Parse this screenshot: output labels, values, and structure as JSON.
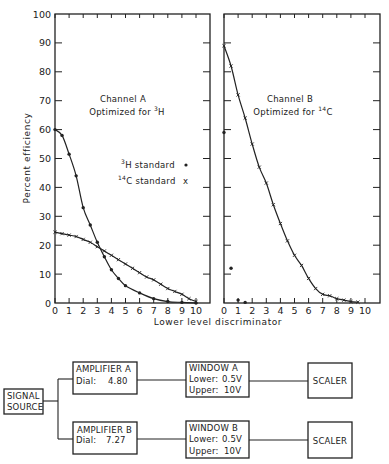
{
  "chart_data": [
    {
      "type": "line",
      "panel": "left",
      "title": "Channel A",
      "subtitle": "Optimized for 3H",
      "subtitle_parts": {
        "text": "Optimized for ",
        "sup": "3",
        "tail": "H"
      },
      "xlabel": "Lower level discriminator",
      "ylabel": "Percent efficiency",
      "xlim": [
        0,
        10
      ],
      "ylim": [
        0,
        100
      ],
      "x_ticks": [
        "0",
        "1",
        "2",
        "3",
        "4",
        "5",
        "6",
        "7",
        "8",
        "9",
        "10"
      ],
      "y_ticks": [
        "0",
        "10",
        "20",
        "30",
        "40",
        "50",
        "60",
        "70",
        "80",
        "90",
        "100"
      ],
      "y_tick_values": [
        0,
        10,
        20,
        30,
        40,
        50,
        60,
        70,
        80,
        90,
        100
      ],
      "grid": false,
      "legend": {
        "placement": "center-right",
        "entries": [
          {
            "sup": "3",
            "label": "H standard",
            "marker": "dot",
            "symbol": "•"
          },
          {
            "sup": "14",
            "label": "C standard",
            "marker": "cross",
            "symbol": "x"
          }
        ]
      },
      "series": [
        {
          "name": "3H standard",
          "marker": "dot",
          "x": [
            0,
            0.5,
            1,
            1.5,
            2,
            2.5,
            3,
            3.5,
            4,
            4.5,
            5,
            6,
            7,
            8,
            9,
            10
          ],
          "y": [
            60,
            58,
            51.5,
            44,
            33,
            27,
            21,
            16,
            11.5,
            8.5,
            6,
            3.5,
            1.5,
            0.5,
            0.2,
            0
          ]
        },
        {
          "name": "14C standard",
          "marker": "cross",
          "x": [
            0,
            0.5,
            1,
            1.5,
            2,
            2.5,
            3,
            3.5,
            4,
            4.5,
            5,
            5.5,
            6,
            6.5,
            7,
            7.5,
            8,
            8.5,
            9,
            9.5,
            10
          ],
          "y": [
            24.5,
            24,
            23.5,
            23,
            22,
            21,
            19.5,
            18,
            16.5,
            15,
            13.5,
            12,
            10.5,
            9,
            8,
            6.5,
            5,
            4,
            3,
            1.5,
            0.5
          ]
        }
      ]
    },
    {
      "type": "line",
      "panel": "right",
      "title": "Channel B",
      "subtitle": "Optimized for 14C",
      "subtitle_parts": {
        "text": "Optimized for ",
        "sup": "14",
        "tail": "C"
      },
      "xlabel": "Lower level discriminator",
      "ylabel": "Percent efficiency",
      "xlim": [
        0,
        10
      ],
      "ylim": [
        0,
        100
      ],
      "x_ticks": [
        "0",
        "1",
        "2",
        "3",
        "4",
        "5",
        "6",
        "7",
        "8",
        "9",
        "10"
      ],
      "y_tick_values": [
        0,
        10,
        20,
        30,
        40,
        50,
        60,
        70,
        80,
        90,
        100
      ],
      "grid": false,
      "series": [
        {
          "name": "14C standard",
          "marker": "cross",
          "x": [
            0,
            0.5,
            1,
            1.5,
            2,
            2.5,
            3,
            3.5,
            4,
            4.5,
            5,
            5.5,
            6,
            6.5,
            7,
            7.5,
            8,
            8.5,
            9,
            9.5
          ],
          "y": [
            89,
            82,
            72,
            64,
            55,
            47,
            41.5,
            34,
            27.5,
            21.5,
            16.5,
            13,
            8.5,
            5,
            3,
            2.5,
            1.5,
            1,
            0.5,
            0.3
          ]
        },
        {
          "name": "3H standard",
          "marker": "dot",
          "x": [
            0,
            0.5,
            1,
            1.5
          ],
          "y": [
            59,
            12,
            1,
            0.2
          ]
        }
      ]
    }
  ],
  "diagram": {
    "signal_source": {
      "line1": "SIGNAL",
      "line2": "SOURCE"
    },
    "channels": [
      {
        "amplifier": {
          "title": "AMPLIFIER A",
          "dial_label": "Dial:",
          "dial_value": "4.80"
        },
        "window": {
          "title": "WINDOW A",
          "lower_label": "Lower:",
          "lower_value": "0.5V",
          "upper_label": "Upper:",
          "upper_value": "10V"
        },
        "scaler": "SCALER"
      },
      {
        "amplifier": {
          "title": "AMPLIFIER B",
          "dial_label": "Dial:",
          "dial_value": "7.27"
        },
        "window": {
          "title": "WINDOW B",
          "lower_label": "Lower:",
          "lower_value": "0.5V",
          "upper_label": "Upper:",
          "upper_value": "10V"
        },
        "scaler": "SCALER"
      }
    ]
  }
}
